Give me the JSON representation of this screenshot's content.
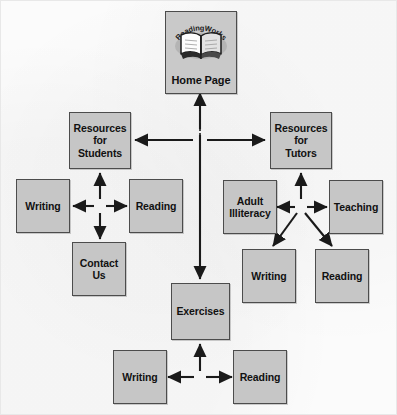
{
  "diagram": {
    "type": "site-map flowchart",
    "colors": {
      "node_fill": "#c6c6c6",
      "node_border": "#4c4c4c",
      "arrow": "#1a1a1a",
      "background": "#fbfbfb",
      "text": "#111111"
    }
  },
  "logo": {
    "wordmark": "ReadingWorks",
    "icon": "open-book-icon"
  },
  "nodes": {
    "home": {
      "label": "Home Page"
    },
    "resources_students": {
      "label": "Resources for Students",
      "line1": "Resources",
      "line2": "for",
      "line3": "Students"
    },
    "resources_tutors": {
      "label": "Resources for Tutors",
      "line1": "Resources",
      "line2": "for",
      "line3": "Tutors"
    },
    "students_writing": {
      "label": "Writing"
    },
    "students_reading": {
      "label": "Reading"
    },
    "contact_us": {
      "label": "Contact Us",
      "line1": "Contact",
      "line2": "Us"
    },
    "adult_illiteracy": {
      "label": "Adult Illiteracy",
      "line1": "Adult",
      "line2": "Illiteracy"
    },
    "teaching": {
      "label": "Teaching"
    },
    "tutors_writing": {
      "label": "Writing"
    },
    "tutors_reading": {
      "label": "Reading"
    },
    "exercises": {
      "label": "Exercises"
    },
    "exercises_writing": {
      "label": "Writing"
    },
    "exercises_reading": {
      "label": "Reading"
    }
  },
  "connections": [
    {
      "from": "home",
      "to": "exercises",
      "style": "double-arrow-vertical"
    },
    {
      "from": "hub-top",
      "to": "resources_students",
      "style": "arrow-left"
    },
    {
      "from": "hub-top",
      "to": "resources_tutors",
      "style": "arrow-right"
    },
    {
      "from": "resources_students",
      "to": "students-hub",
      "style": "arrow-up"
    },
    {
      "from": "students-hub",
      "to": "students_writing",
      "style": "arrow-left"
    },
    {
      "from": "students-hub",
      "to": "students_reading",
      "style": "arrow-right"
    },
    {
      "from": "students-hub",
      "to": "contact_us",
      "style": "arrow-down"
    },
    {
      "from": "resources_tutors",
      "to": "tutors-hub",
      "style": "arrow-up"
    },
    {
      "from": "tutors-hub",
      "to": "adult_illiteracy",
      "style": "arrow-left"
    },
    {
      "from": "tutors-hub",
      "to": "teaching",
      "style": "arrow-right"
    },
    {
      "from": "tutors-hub",
      "to": "tutors_writing",
      "style": "arrow-diagonal-down-left"
    },
    {
      "from": "tutors-hub",
      "to": "tutors_reading",
      "style": "arrow-diagonal-down-right"
    },
    {
      "from": "exercises",
      "to": "exercises-hub",
      "style": "arrow-up"
    },
    {
      "from": "exercises-hub",
      "to": "exercises_writing",
      "style": "arrow-left"
    },
    {
      "from": "exercises-hub",
      "to": "exercises_reading",
      "style": "arrow-right"
    }
  ]
}
